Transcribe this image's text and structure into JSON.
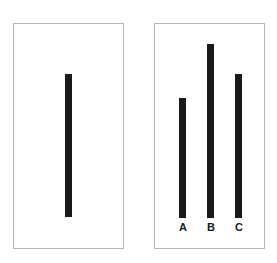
{
  "reference_card": {
    "line_length": 143
  },
  "comparison_card": {
    "lines": [
      {
        "label": "A",
        "length": 120
      },
      {
        "label": "B",
        "length": 174
      },
      {
        "label": "C",
        "length": 144
      }
    ]
  }
}
